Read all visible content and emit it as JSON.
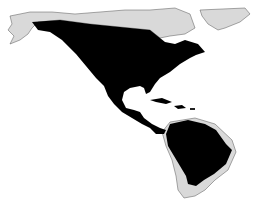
{
  "map": {
    "type": "species-range-map",
    "region": "Americas",
    "colors": {
      "background": "#ffffff",
      "land": "#d9d9d9",
      "range": "#000000",
      "border": "#555555"
    }
  }
}
